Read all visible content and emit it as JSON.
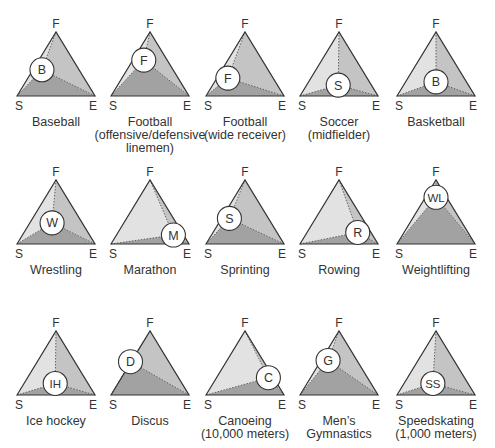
{
  "figure": {
    "vertex_labels": {
      "top": "F",
      "left": "S",
      "right": "E"
    },
    "colors": {
      "left_region": "#e2e2e2",
      "right_region": "#c4c4c4",
      "bottom_region": "#a2a2a2",
      "outline": "#333333",
      "marker_fill": "#ffffff"
    },
    "panels": [
      {
        "name": "Baseball",
        "lines": [
          "Baseball"
        ],
        "marker": "B",
        "px": 0.32,
        "py": 0.59
      },
      {
        "name": "Football (offensive/defensive linemen)",
        "lines": [
          "Football",
          "(offensive/defensive",
          "linemen)"
        ],
        "marker": "F",
        "px": 0.42,
        "py": 0.44
      },
      {
        "name": "Football (wide receiver)",
        "lines": [
          "Football",
          "(wide receiver)"
        ],
        "marker": "F",
        "px": 0.28,
        "py": 0.72
      },
      {
        "name": "Soccer (midfielder)",
        "lines": [
          "Soccer",
          "(midfielder)"
        ],
        "marker": "S",
        "px": 0.49,
        "py": 0.83
      },
      {
        "name": "Basketball",
        "lines": [
          "Basketball"
        ],
        "marker": "B",
        "px": 0.5,
        "py": 0.78
      },
      {
        "name": "Wrestling",
        "lines": [
          "Wrestling"
        ],
        "marker": "W",
        "px": 0.45,
        "py": 0.67
      },
      {
        "name": "Marathon",
        "lines": [
          "Marathon"
        ],
        "marker": "M",
        "px": 0.8,
        "py": 0.86
      },
      {
        "name": "Sprinting",
        "lines": [
          "Sprinting"
        ],
        "marker": "S",
        "px": 0.3,
        "py": 0.6
      },
      {
        "name": "Rowing",
        "lines": [
          "Rowing"
        ],
        "marker": "R",
        "px": 0.74,
        "py": 0.82
      },
      {
        "name": "Weightlifting",
        "lines": [
          "Weightlifting"
        ],
        "marker": "WL",
        "px": 0.5,
        "py": 0.27
      },
      {
        "name": "Ice hockey",
        "lines": [
          "Ice hockey"
        ],
        "marker": "IH",
        "px": 0.49,
        "py": 0.82
      },
      {
        "name": "Discus",
        "lines": [
          "Discus"
        ],
        "marker": "D",
        "px": 0.25,
        "py": 0.48
      },
      {
        "name": "Canoeing (10,000 meters)",
        "lines": [
          "Canoeing",
          "(10,000 meters)"
        ],
        "marker": "C",
        "px": 0.8,
        "py": 0.73
      },
      {
        "name": "Men's Gymnastics",
        "lines": [
          "Men’s",
          "Gymnastics"
        ],
        "marker": "G",
        "px": 0.36,
        "py": 0.46
      },
      {
        "name": "Speedskating (1,000 meters)",
        "lines": [
          "Speedskating",
          "(1,000 meters)"
        ],
        "marker": "SS",
        "px": 0.46,
        "py": 0.82
      }
    ]
  },
  "layout": {
    "col_apex_x": [
      56,
      150,
      245,
      339,
      436
    ],
    "row_apex_y": [
      32,
      180,
      331
    ],
    "tri_half_width": 39,
    "tri_height": 64
  }
}
